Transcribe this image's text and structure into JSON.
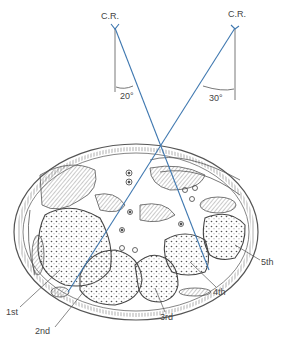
{
  "figure": {
    "central_ray_left": {
      "label": "C.R.",
      "angle": "20°"
    },
    "central_ray_right": {
      "label": "C.R.",
      "angle": "30°"
    },
    "bones": [
      {
        "label": "1st"
      },
      {
        "label": "2nd"
      },
      {
        "label": "3rd"
      },
      {
        "label": "4th"
      },
      {
        "label": "5th"
      }
    ]
  },
  "colors": {
    "ray": "#3f78b0",
    "ink": "#555555"
  }
}
